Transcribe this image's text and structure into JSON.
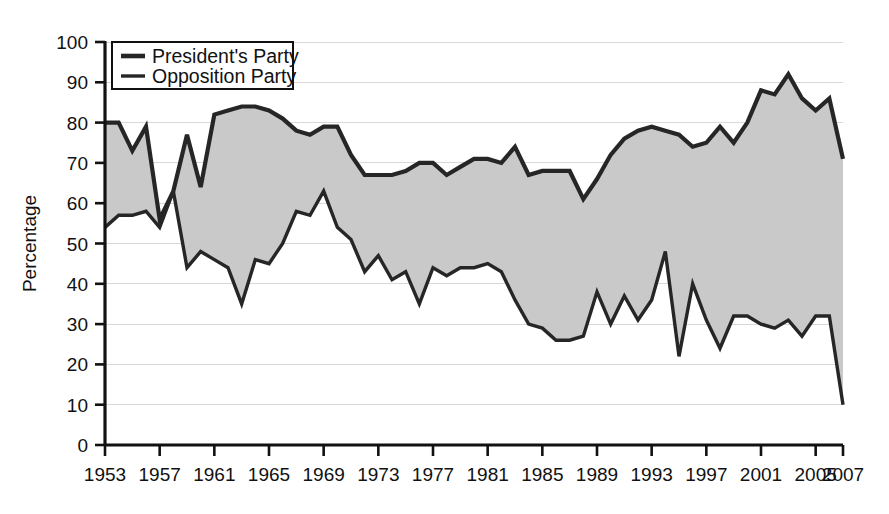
{
  "chart_data": {
    "type": "line",
    "subtype": "two-series-with-shaded-gap",
    "title": "",
    "subtitle": "",
    "xlabel": "",
    "ylabel": "Percentage",
    "xlim": [
      1953,
      2007
    ],
    "ylim": [
      0,
      100
    ],
    "yticks": [
      0,
      10,
      20,
      30,
      40,
      50,
      60,
      70,
      80,
      90,
      100
    ],
    "xticks": [
      1953,
      1957,
      1961,
      1965,
      1969,
      1973,
      1977,
      1981,
      1985,
      1989,
      1993,
      1997,
      2001,
      2005,
      2007
    ],
    "xtick_labels": [
      "1953",
      "1957",
      "1961",
      "1965",
      "1969",
      "1973",
      "1977",
      "1981",
      "1985",
      "1989",
      "1993",
      "1997",
      "2001",
      "2005",
      "2007"
    ],
    "ytick_labels": [
      "0",
      "10",
      "20",
      "30",
      "40",
      "50",
      "60",
      "70",
      "80",
      "90",
      "100"
    ],
    "grid": true,
    "grid_axis": "y",
    "legend_position": "upper-left-inside",
    "fill_between_color": "#c9c9c9",
    "line_color": "#262626",
    "x": [
      1953,
      1954,
      1955,
      1956,
      1957,
      1958,
      1959,
      1960,
      1961,
      1962,
      1963,
      1964,
      1965,
      1966,
      1967,
      1968,
      1969,
      1970,
      1971,
      1972,
      1973,
      1974,
      1975,
      1976,
      1977,
      1978,
      1979,
      1980,
      1981,
      1982,
      1983,
      1984,
      1985,
      1986,
      1987,
      1988,
      1989,
      1990,
      1991,
      1992,
      1993,
      1994,
      1995,
      1996,
      1997,
      1998,
      1999,
      2000,
      2001,
      2002,
      2003,
      2004,
      2005,
      2006,
      2007
    ],
    "series": [
      {
        "name": "President's Party",
        "line_width": 4.2,
        "values": [
          80,
          80,
          73,
          79,
          56,
          63,
          77,
          64,
          82,
          83,
          84,
          84,
          83,
          81,
          78,
          77,
          79,
          79,
          72,
          67,
          67,
          67,
          68,
          70,
          70,
          67,
          69,
          71,
          71,
          70,
          74,
          67,
          68,
          68,
          68,
          61,
          66,
          72,
          76,
          78,
          79,
          78,
          77,
          74,
          75,
          79,
          75,
          80,
          88,
          87,
          92,
          86,
          83,
          86,
          71
        ]
      },
      {
        "name": "Opposition Party",
        "line_width": 3.4,
        "values": [
          54,
          57,
          57,
          58,
          54,
          63,
          44,
          48,
          46,
          44,
          35,
          46,
          45,
          50,
          58,
          57,
          63,
          54,
          51,
          43,
          47,
          41,
          43,
          35,
          44,
          42,
          44,
          44,
          45,
          43,
          36,
          30,
          29,
          26,
          26,
          27,
          38,
          30,
          37,
          31,
          36,
          48,
          22,
          40,
          31,
          24,
          32,
          32,
          30,
          29,
          31,
          27,
          32,
          32,
          10
        ]
      }
    ],
    "legend": [
      {
        "label": "President's Party",
        "swatch_weight": "thick"
      },
      {
        "label": "Opposition Party",
        "swatch_weight": "medium"
      }
    ]
  },
  "axes": {
    "ylabel": "Percentage"
  }
}
